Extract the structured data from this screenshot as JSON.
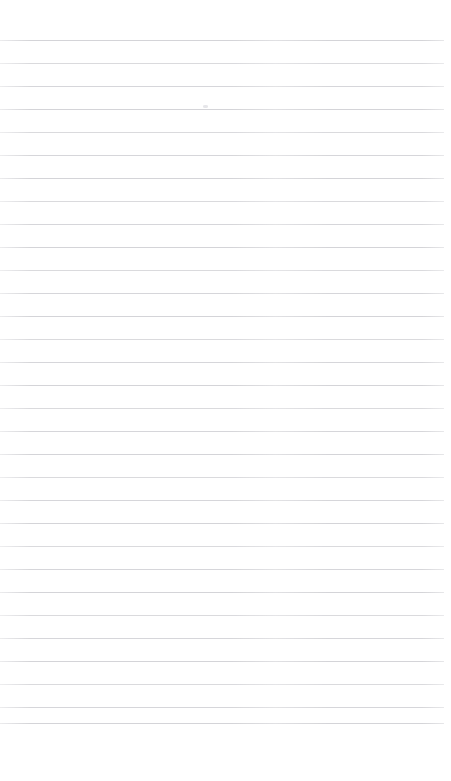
{
  "document": {
    "title": "Ruled Notebook Page",
    "type": "lined-paper",
    "content_text": "",
    "page_width": 451,
    "page_height": 781,
    "background_color": "#ffffff"
  },
  "ruling": {
    "line_color": "#d2d2d6",
    "line_thickness": 1,
    "line_spacing": 23,
    "first_line_y": 40,
    "last_line_y": 723,
    "line_count": 31,
    "line_left_x": 0,
    "line_right_x": 444,
    "line_length": 444
  },
  "margins": {
    "top_margin_height": 40,
    "bottom_margin_height": 58,
    "right_margin_width": 7,
    "left_margin_width": 0
  },
  "artifacts": [
    {
      "name": "faint-smudge",
      "x": 203,
      "y": 105,
      "width": 5,
      "height": 3,
      "color": "#e2e2e6"
    }
  ],
  "line_y_positions": [
    40,
    63,
    86,
    109,
    132,
    155,
    178,
    201,
    224,
    247,
    270,
    293,
    316,
    339,
    362,
    385,
    408,
    431,
    454,
    477,
    500,
    523,
    546,
    569,
    592,
    615,
    638,
    661,
    684,
    707,
    723
  ]
}
